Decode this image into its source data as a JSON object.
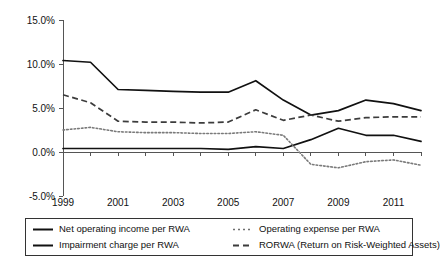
{
  "chart_data": {
    "type": "line",
    "title": "",
    "subtitle": "",
    "xlabel": "",
    "ylabel": "",
    "x": [
      1999,
      2000,
      2001,
      2002,
      2003,
      2004,
      2005,
      2006,
      2007,
      2008,
      2009,
      2010,
      2011,
      2012
    ],
    "x_tick_labels": [
      "1999",
      "",
      "2001",
      "",
      "2003",
      "",
      "2005",
      "",
      "2007",
      "",
      "2009",
      "",
      "2011",
      ""
    ],
    "x_tick_labels_visible": [
      "1999",
      "2001",
      "2003",
      "2005",
      "2007",
      "2009",
      "2011"
    ],
    "xlim": [
      1999,
      2012
    ],
    "ylim": [
      -5.0,
      15.0
    ],
    "y_ticks": [
      -5.0,
      0.0,
      5.0,
      10.0,
      15.0
    ],
    "y_tick_labels": [
      "-5.0%",
      "0.0%",
      "5.0%",
      "10.0%",
      "15.0%"
    ],
    "grid": false,
    "legend_position": "below",
    "units": "percent",
    "series": [
      {
        "name": "Net operating income per RWA",
        "style": "solid",
        "color": "#111111",
        "values": [
          10.4,
          10.2,
          7.1,
          7.0,
          6.9,
          6.8,
          6.8,
          8.1,
          5.9,
          4.2,
          4.7,
          5.9,
          5.5,
          4.7
        ]
      },
      {
        "name": "Impairment charge per RWA",
        "style": "solid",
        "color": "#111111",
        "values": [
          0.4,
          0.4,
          0.4,
          0.4,
          0.4,
          0.4,
          0.3,
          0.6,
          0.4,
          1.4,
          2.7,
          1.9,
          1.9,
          1.2
        ]
      },
      {
        "name": "Operating expense per RWA",
        "style": "dotted",
        "color": "#7a7a7a",
        "values": [
          2.5,
          2.8,
          2.3,
          2.2,
          2.2,
          2.1,
          2.1,
          2.3,
          1.9,
          -1.4,
          -1.8,
          -1.1,
          -0.9,
          -1.5
        ]
      },
      {
        "name": "RORWA (Return on Risk-Weighted Assets)",
        "style": "dashed",
        "color": "#3c3c3c",
        "values": [
          6.5,
          5.6,
          3.5,
          3.4,
          3.4,
          3.3,
          3.4,
          4.8,
          3.6,
          4.2,
          3.5,
          3.9,
          4.0,
          4.0
        ]
      }
    ]
  },
  "legend": {
    "items": [
      {
        "label": "Net operating income per RWA",
        "style": "solid"
      },
      {
        "label": "Operating expense per RWA",
        "style": "dotted"
      },
      {
        "label": "Impairment charge per RWA",
        "style": "solid"
      },
      {
        "label": "RORWA (Return on Risk-Weighted Assets)",
        "style": "dashed"
      }
    ]
  }
}
